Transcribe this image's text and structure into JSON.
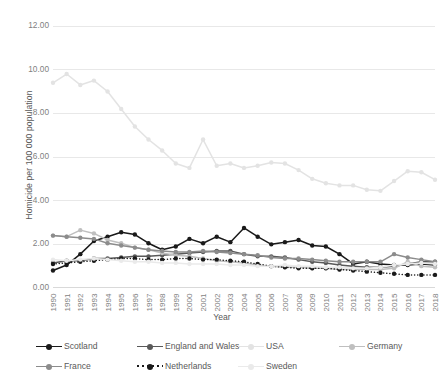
{
  "chart_data": {
    "type": "line",
    "title": "",
    "xlabel": "Year",
    "ylabel": "Homicide per 100 000 population",
    "ylim": [
      0,
      12
    ],
    "ytick_step": 2,
    "ytick_labels": [
      "0.00",
      "2.00",
      "4.00",
      "6.00",
      "8.00",
      "10.00",
      "12.00"
    ],
    "grid": true,
    "legend_position": "bottom",
    "categories": [
      "1990",
      "1991",
      "1992",
      "1993",
      "1994",
      "1995",
      "1996",
      "1997",
      "1998",
      "1999",
      "2000",
      "2001",
      "2002",
      "2003",
      "2004",
      "2005",
      "2006",
      "2007",
      "2008",
      "2009",
      "2010",
      "2011",
      "2012",
      "2013",
      "2014",
      "2015",
      "2016",
      "2017",
      "2018"
    ],
    "series": [
      {
        "name": "Scotland",
        "color": "#1a1a1a",
        "style": "solid",
        "marker": "circle",
        "values": [
          0.8,
          1.05,
          1.55,
          2.15,
          2.35,
          2.55,
          2.45,
          2.05,
          1.75,
          1.9,
          2.25,
          2.05,
          2.35,
          2.1,
          2.75,
          2.35,
          2.0,
          2.1,
          2.2,
          1.95,
          1.9,
          1.55,
          1.1,
          1.2,
          1.1,
          1.05,
          1.05,
          1.1,
          1.05
        ]
      },
      {
        "name": "England and Wales",
        "color": "#595959",
        "style": "solid",
        "marker": "circle",
        "values": [
          1.15,
          1.25,
          1.25,
          1.35,
          1.35,
          1.4,
          1.45,
          1.45,
          1.5,
          1.55,
          1.6,
          1.65,
          1.7,
          1.7,
          1.55,
          1.45,
          1.45,
          1.4,
          1.3,
          1.2,
          1.15,
          1.05,
          1.0,
          0.95,
          0.95,
          1.0,
          1.1,
          1.2,
          1.2
        ]
      },
      {
        "name": "USA",
        "color": "#e3e3e3",
        "style": "solid",
        "marker": "circle",
        "values": [
          9.4,
          9.8,
          9.3,
          9.5,
          9.0,
          8.2,
          7.4,
          6.8,
          6.3,
          5.7,
          5.5,
          6.8,
          5.6,
          5.7,
          5.5,
          5.6,
          5.75,
          5.7,
          5.4,
          5.0,
          4.8,
          4.7,
          4.7,
          4.5,
          4.45,
          4.9,
          5.35,
          5.3,
          4.96
        ]
      },
      {
        "name": "Germany",
        "color": "#bfbfbf",
        "style": "solid",
        "marker": "circle",
        "values": [
          2.4,
          2.35,
          2.65,
          2.5,
          2.2,
          2.05,
          1.85,
          1.75,
          1.6,
          1.5,
          1.45,
          1.35,
          1.25,
          1.2,
          1.15,
          1.05,
          1.0,
          0.95,
          0.95,
          0.9,
          0.9,
          0.85,
          0.85,
          0.85,
          0.85,
          0.9,
          1.2,
          1.0,
          0.95
        ]
      },
      {
        "name": "France",
        "color": "#8c8c8c",
        "style": "solid",
        "marker": "circle",
        "values": [
          2.4,
          2.35,
          2.3,
          2.25,
          2.05,
          1.95,
          1.85,
          1.75,
          1.7,
          1.65,
          1.65,
          1.7,
          1.65,
          1.6,
          1.55,
          1.5,
          1.4,
          1.35,
          1.35,
          1.3,
          1.25,
          1.2,
          1.2,
          1.2,
          1.2,
          1.55,
          1.4,
          1.3,
          1.2
        ]
      },
      {
        "name": "Netherlands",
        "color": "#1a1a1a",
        "style": "dotted",
        "marker": "circle",
        "values": [
          1.1,
          1.15,
          1.2,
          1.25,
          1.3,
          1.35,
          1.35,
          1.3,
          1.3,
          1.35,
          1.35,
          1.3,
          1.3,
          1.25,
          1.2,
          1.1,
          1.0,
          0.95,
          0.9,
          0.9,
          0.9,
          0.85,
          0.8,
          0.75,
          0.7,
          0.65,
          0.6,
          0.6,
          0.6
        ]
      },
      {
        "name": "Sweden",
        "color": "#eaeaea",
        "style": "solid",
        "marker": "circle",
        "values": [
          1.3,
          1.25,
          1.3,
          1.35,
          1.3,
          1.25,
          1.2,
          1.2,
          1.15,
          1.15,
          1.1,
          1.1,
          1.1,
          1.05,
          1.05,
          1.0,
          1.0,
          1.05,
          1.0,
          1.0,
          0.95,
          0.95,
          0.9,
          0.9,
          0.95,
          1.05,
          1.1,
          1.15,
          1.1
        ]
      }
    ]
  },
  "legend": {
    "rows": [
      [
        {
          "label": "Scotland",
          "series": 0
        },
        {
          "label": "England and Wales",
          "series": 1
        },
        {
          "label": "USA",
          "series": 2
        },
        {
          "label": "Germany",
          "series": 3
        }
      ],
      [
        {
          "label": "France",
          "series": 4
        },
        {
          "label": "Netherlands",
          "series": 5
        },
        {
          "label": "Sweden",
          "series": 6
        }
      ]
    ]
  }
}
